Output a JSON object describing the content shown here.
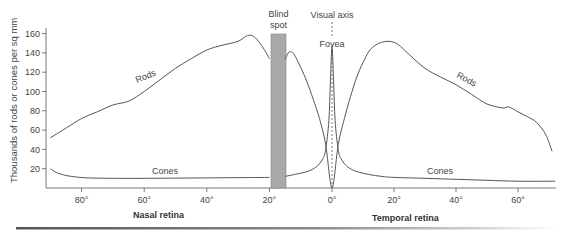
{
  "chart_data": {
    "type": "line",
    "title": "",
    "xlabel_left": "Nasal retina",
    "xlabel_right": "Temporal retina",
    "ylabel": "Thousands of rods or cones per sq mm",
    "x_unit": "degrees from fovea (nasal negative, temporal positive)",
    "xlim": [
      -90,
      72
    ],
    "ylim": [
      0,
      165
    ],
    "x_tick_labels": [
      "80°",
      "60°",
      "40°",
      "20°",
      "0°",
      "20°",
      "40°",
      "60°"
    ],
    "x_tick_values": [
      -80,
      -60,
      -40,
      -20,
      0,
      20,
      40,
      60
    ],
    "y_tick_labels": [
      "20",
      "40",
      "60",
      "80",
      "100",
      "120",
      "140",
      "160"
    ],
    "y_tick_values": [
      20,
      40,
      60,
      80,
      100,
      120,
      140,
      160
    ],
    "grid": false,
    "series": [
      {
        "name": "Rods",
        "segments": [
          {
            "x": [
              -90,
              -85,
              -80,
              -75,
              -70,
              -65,
              -60,
              -55,
              -50,
              -45,
              -40,
              -35,
              -30,
              -27,
              -25,
              -23,
              -21,
              -20
            ],
            "y": [
              52,
              62,
              72,
              79,
              86,
              90,
              100,
              112,
              124,
              134,
              143,
              148,
              152,
              158,
              157,
              150,
              140,
              134
            ]
          },
          {
            "x": [
              -15,
              -14,
              -13,
              -12,
              -10,
              -8,
              -6,
              -4,
              -2,
              0,
              2,
              4,
              6,
              8,
              10,
              12,
              14,
              16,
              18,
              20,
              22,
              25,
              30,
              35,
              40,
              45,
              50,
              55,
              57,
              60,
              63,
              66,
              69,
              71
            ],
            "y": [
              133,
              140,
              141,
              138,
              125,
              110,
              92,
              72,
              45,
              0,
              45,
              72,
              95,
              115,
              130,
              142,
              148,
              151,
              152,
              151,
              147,
              138,
              124,
              115,
              107,
              97,
              87,
              83,
              84,
              79,
              74,
              68,
              55,
              38
            ]
          }
        ]
      },
      {
        "name": "Cones",
        "segments": [
          {
            "x": [
              -90,
              -88,
              -85,
              -82,
              -78,
              -70,
              -60,
              -40,
              -20
            ],
            "y": [
              20,
              16,
              13,
              11.5,
              10.5,
              10,
              10,
              10.5,
              11
            ]
          },
          {
            "x": [
              -15,
              -12,
              -8,
              -5,
              -3,
              -2,
              -1,
              -0.5,
              0,
              0.5,
              1,
              2,
              3,
              5,
              8,
              12,
              16,
              20,
              30,
              40,
              50,
              60,
              72
            ],
            "y": [
              12,
              14,
              17,
              22,
              30,
              40,
              70,
              110,
              147,
              110,
              70,
              40,
              30,
              22,
              17,
              14,
              12,
              11,
              10,
              9,
              8,
              7,
              7
            ]
          }
        ]
      }
    ],
    "annotations": [
      {
        "text": "Blind spot",
        "x_range": [
          -19,
          -15
        ],
        "type": "shaded_band"
      },
      {
        "text": "Visual axis",
        "x": 0,
        "type": "dashed_vertical_line"
      },
      {
        "text": "Fovea",
        "x": 0
      },
      {
        "text": "Rods",
        "x": -60,
        "y": 108
      },
      {
        "text": "Rods",
        "x": 45,
        "y": 108
      },
      {
        "text": "Cones",
        "x": -50,
        "y": 18
      },
      {
        "text": "Cones",
        "x": 40,
        "y": 17
      }
    ]
  },
  "labels": {
    "ylabel": "Thousands of rods or cones per sq mm",
    "nasal": "Nasal retina",
    "temporal": "Temporal retina",
    "blind_line1": "Blind",
    "blind_line2": "spot",
    "visual_axis": "Visual axis",
    "fovea": "Fovea",
    "rods_left": "Rods",
    "rods_right": "Rods",
    "cones_left": "Cones",
    "cones_right": "Cones"
  },
  "colors": {
    "curve": "#555555",
    "axis": "#777777",
    "blind_spot_fill": "#a9a9a9",
    "text": "#444444"
  }
}
